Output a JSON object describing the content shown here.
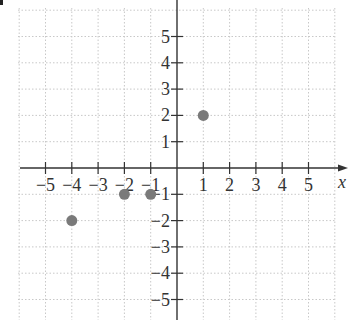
{
  "chart_data": {
    "type": "scatter",
    "title": "",
    "xlabel": "x",
    "ylabel": "",
    "xlim": [
      -6,
      6
    ],
    "ylim": [
      -6,
      6
    ],
    "grid": true,
    "x_ticks": [
      -5,
      -4,
      -3,
      -2,
      -1,
      1,
      2,
      3,
      4,
      5
    ],
    "y_ticks": [
      5,
      4,
      3,
      2,
      1,
      -1,
      -2,
      -3,
      -4,
      -5
    ],
    "x_tick_labels": [
      "−5",
      "−4",
      "−3",
      "−2",
      "−1",
      "1",
      "2",
      "3",
      "4",
      "5"
    ],
    "y_tick_labels": [
      "5",
      "4",
      "3",
      "2",
      "1",
      "−1",
      "−2",
      "−3",
      "−4",
      "−5"
    ],
    "points": [
      {
        "x": -4,
        "y": -2
      },
      {
        "x": -2,
        "y": -1
      },
      {
        "x": -1,
        "y": -1
      },
      {
        "x": 1,
        "y": 2
      }
    ],
    "point_color": "#7a7a7a",
    "axis_color": "#333333",
    "grid_color": "#c8c8c8"
  }
}
